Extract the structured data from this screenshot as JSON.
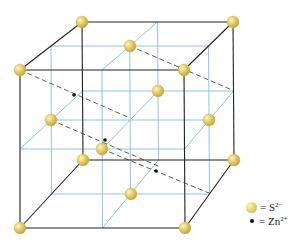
{
  "figure": {
    "colors": {
      "cube_edge": "#222222",
      "grid_line": "#7cc4de",
      "dashed_line": "#333333",
      "sulfide_ball": "#e6cf6a",
      "zinc_dot": "#111111",
      "background": "#ffffff"
    },
    "cube": {
      "corners": {
        "front_top_left": [
          20,
          70
        ],
        "front_top_right": [
          184,
          70
        ],
        "front_bottom_left": [
          20,
          228
        ],
        "front_bottom_right": [
          185,
          228
        ],
        "back_top_left": [
          82,
          22
        ],
        "back_top_right": [
          233,
          22
        ],
        "back_bottom_left": [
          83,
          160
        ],
        "back_bottom_right": [
          234,
          160
        ]
      }
    },
    "sulfide_positions": [
      [
        82,
        22
      ],
      [
        233,
        22
      ],
      [
        20,
        70
      ],
      [
        184,
        70
      ],
      [
        83,
        160
      ],
      [
        234,
        160
      ],
      [
        20,
        228
      ],
      [
        185,
        228
      ],
      [
        130,
        46
      ],
      [
        131,
        194
      ],
      [
        51,
        120
      ],
      [
        209,
        120
      ],
      [
        158,
        91
      ],
      [
        102,
        149
      ]
    ],
    "zinc_positions": [
      [
        180,
        68
      ],
      [
        74,
        95
      ],
      [
        105,
        140
      ],
      [
        156,
        171
      ]
    ],
    "dashed_lines": [
      [
        [
          130,
          46
        ],
        [
          232,
          90
        ]
      ],
      [
        [
          20,
          70
        ],
        [
          130,
          118
        ]
      ],
      [
        [
          51,
          120
        ],
        [
          158,
          166
        ]
      ],
      [
        [
          102,
          149
        ],
        [
          209,
          193
        ]
      ]
    ]
  },
  "legend": {
    "items": [
      {
        "symbol": "yellow-ball",
        "eq": "= S",
        "sup": "2−"
      },
      {
        "symbol": "black-dot",
        "eq": "= Zn",
        "sup": "2+"
      }
    ]
  }
}
